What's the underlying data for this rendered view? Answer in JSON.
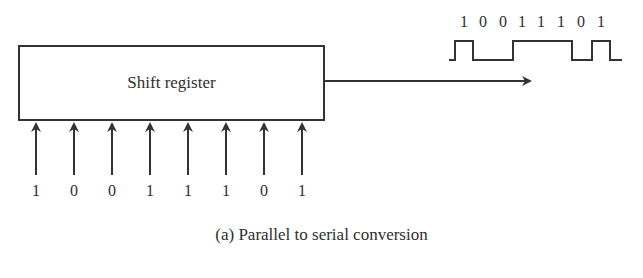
{
  "diagram": {
    "register_label": "Shift register",
    "parallel_inputs": [
      "1",
      "0",
      "0",
      "1",
      "1",
      "1",
      "0",
      "1"
    ],
    "serial_output_bits": [
      "1",
      "0",
      "0",
      "1",
      "1",
      "1",
      "0",
      "1"
    ],
    "caption": "(a) Parallel to serial conversion"
  }
}
